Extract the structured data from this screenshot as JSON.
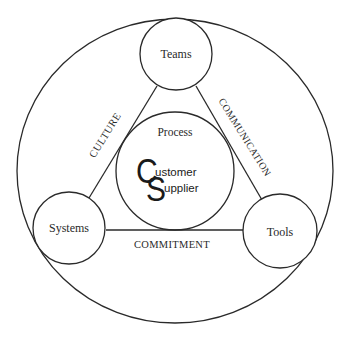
{
  "diagram": {
    "type": "triangle-in-circle",
    "nodes": {
      "top": {
        "label": "Teams"
      },
      "left": {
        "label": "Systems"
      },
      "right": {
        "label": "Tools"
      }
    },
    "center": {
      "heading": "Process",
      "logo": {
        "big_letter_1": "C",
        "big_letter_2": "S",
        "line1": "ustomer",
        "line2": "upplier",
        "full_line1": "Customer",
        "full_line2": "Supplier"
      }
    },
    "edges": {
      "left": {
        "label": "CULTURE",
        "from": "Teams",
        "to": "Systems"
      },
      "right": {
        "label": "COMMUNICATION",
        "from": "Teams",
        "to": "Tools"
      },
      "bottom": {
        "label": "COMMITMENT",
        "from": "Systems",
        "to": "Tools"
      }
    },
    "colors": {
      "line": "#2a2a2a",
      "background": "#ffffff",
      "text": "#2a2a2a"
    }
  }
}
